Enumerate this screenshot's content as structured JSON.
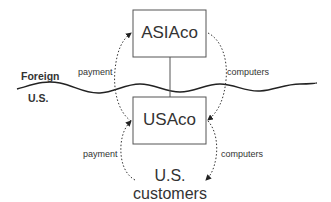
{
  "diagram": {
    "nodes": {
      "asiaco": {
        "label": "ASIAco"
      },
      "usaco": {
        "label": "USAco"
      },
      "customers": {
        "line1": "U.S.",
        "line2": "customers"
      }
    },
    "regions": {
      "foreign": "Foreign",
      "us": "U.S."
    },
    "flows": {
      "upper_left": "payment",
      "upper_right": "computers",
      "lower_left": "payment",
      "lower_right": "computers"
    }
  }
}
